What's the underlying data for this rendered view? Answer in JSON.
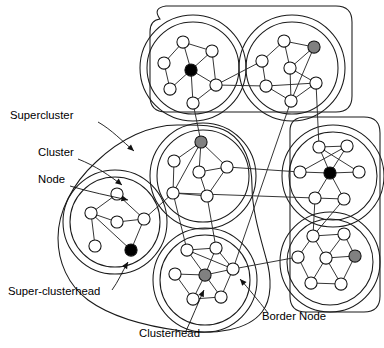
{
  "figure": {
    "node_kinds": {
      "plain": "Node",
      "clusterhead": "Clusterhead",
      "super_clusterhead": "Super-clusterhead",
      "border": "Border Node"
    },
    "colors": {
      "plain_fill": "#ffffff",
      "clusterhead_fill": "#808080",
      "super_clusterhead_fill": "#000000",
      "stroke": "#111111",
      "background": "#ffffff"
    },
    "counts": {
      "superclusters": 3,
      "clusters": 7,
      "clusterheads": 4,
      "super_clusterheads": 3
    }
  },
  "labels": [
    {
      "id": "supercluster",
      "text": "Supercluster",
      "x": 10,
      "y": 119,
      "anchor": "start"
    },
    {
      "id": "cluster",
      "text": "Cluster",
      "x": 38,
      "y": 156,
      "anchor": "start"
    },
    {
      "id": "node",
      "text": "Node",
      "x": 38,
      "y": 183,
      "anchor": "start"
    },
    {
      "id": "super-clusterhead",
      "text": "Super-clusterhead",
      "x": 8,
      "y": 295,
      "anchor": "start"
    },
    {
      "id": "clusterhead",
      "text": "Clusterhead",
      "x": 139,
      "y": 337,
      "anchor": "start"
    },
    {
      "id": "border-node",
      "text": "Border Node",
      "x": 262,
      "y": 320,
      "anchor": "start"
    }
  ],
  "leaders": [
    {
      "id": "leader-supercluster",
      "d": "M 98 122 C 112 130, 122 141, 134 151",
      "arrow": [
        134,
        151,
        0.72
      ]
    },
    {
      "id": "leader-cluster",
      "d": "M 78 159 C 96 166, 110 176, 122 185",
      "arrow": [
        122,
        185,
        0.68
      ]
    },
    {
      "id": "leader-node",
      "d": "M 70 186 C 90 192, 110 196, 128 200",
      "arrow": [
        128,
        200,
        0.25
      ]
    },
    {
      "id": "leader-super-clusterhead",
      "d": "M 112 290 C 118 282, 122 272, 128 262",
      "arrow": [
        128,
        262,
        -1.03
      ]
    },
    {
      "id": "leader-clusterhead",
      "d": "M 186 331 C 192 318, 198 303, 204 290",
      "arrow": [
        204,
        290,
        -1.12
      ]
    },
    {
      "id": "leader-border-node",
      "d": "M 268 313 C 258 300, 248 288, 240 279",
      "arrow": [
        240,
        279,
        -2.3
      ]
    }
  ],
  "superclusters": [
    {
      "id": "supercluster-top",
      "shape": "rounded-rect",
      "d": "M 160 19 Q 152 8 166 6 L 336 6 Q 352 6 352 22 L 352 96 Q 352 112 336 112 L 166 112 Q 150 112 150 96 L 150 32 Q 150 20 160 19 Z",
      "contains": [
        "cluster-top-left",
        "cluster-top-right"
      ]
    },
    {
      "id": "supercluster-right",
      "shape": "rounded-rect-vertical",
      "d": "M 290 131 Q 290 117 306 117 L 364 117 Q 380 117 380 133 L 380 296 Q 380 312 364 312 L 306 312 Q 290 312 290 296 Z",
      "contains": [
        "cluster-right-top",
        "cluster-right-bottom"
      ]
    },
    {
      "id": "supercluster-left",
      "shape": "irregular-blob",
      "d": "M 180 125 C 150 124, 120 139, 96 162 C 72 184, 58 212, 58 238 C 58 262, 68 285, 88 300 C 110 316, 144 326, 182 331 C 216 335, 248 330, 262 312 C 272 299, 272 278, 266 258 C 260 236, 252 210, 252 186 C 252 162, 244 142, 228 132 C 214 124, 196 125, 180 125 Z",
      "contains": [
        "cluster-left",
        "cluster-center",
        "cluster-bottom-center"
      ]
    }
  ],
  "clusters": [
    {
      "id": "cluster-top-left",
      "cx": 193,
      "cy": 68,
      "r": 46,
      "outer_r": 53
    },
    {
      "id": "cluster-top-right",
      "cx": 292,
      "cy": 68,
      "r": 46,
      "outer_r": 53
    },
    {
      "id": "cluster-left",
      "cx": 115,
      "cy": 222,
      "r": 45,
      "outer_r": 52
    },
    {
      "id": "cluster-center",
      "cx": 203,
      "cy": 176,
      "r": 46,
      "outer_r": 53
    },
    {
      "id": "cluster-bottom-center",
      "cx": 205,
      "cy": 280,
      "r": 45,
      "outer_r": 52
    },
    {
      "id": "cluster-right-top",
      "cx": 333,
      "cy": 176,
      "r": 44,
      "outer_r": 51
    },
    {
      "id": "cluster-right-bottom",
      "cx": 330,
      "cy": 262,
      "r": 43,
      "outer_r": 50
    }
  ],
  "nodes": [
    {
      "id": "tl-1",
      "cluster": "cluster-top-left",
      "x": 183,
      "y": 42,
      "kind": "plain"
    },
    {
      "id": "tl-2",
      "cluster": "cluster-top-left",
      "x": 212,
      "y": 51,
      "kind": "plain"
    },
    {
      "id": "tl-3",
      "cluster": "cluster-top-left",
      "x": 164,
      "y": 63,
      "kind": "plain"
    },
    {
      "id": "tl-4",
      "cluster": "cluster-top-left",
      "x": 191,
      "y": 70,
      "kind": "super_clusterhead"
    },
    {
      "id": "tl-5",
      "cluster": "cluster-top-left",
      "x": 170,
      "y": 89,
      "kind": "plain"
    },
    {
      "id": "tl-6",
      "cluster": "cluster-top-left",
      "x": 216,
      "y": 85,
      "kind": "border"
    },
    {
      "id": "tl-7",
      "cluster": "cluster-top-left",
      "x": 193,
      "y": 103,
      "kind": "plain"
    },
    {
      "id": "tr-1",
      "cluster": "cluster-top-right",
      "x": 284,
      "y": 41,
      "kind": "plain"
    },
    {
      "id": "tr-2",
      "cluster": "cluster-top-right",
      "x": 314,
      "y": 47,
      "kind": "clusterhead"
    },
    {
      "id": "tr-3",
      "cluster": "cluster-top-right",
      "x": 262,
      "y": 61,
      "kind": "border"
    },
    {
      "id": "tr-4",
      "cluster": "cluster-top-right",
      "x": 290,
      "y": 68,
      "kind": "plain"
    },
    {
      "id": "tr-5",
      "cluster": "cluster-top-right",
      "x": 266,
      "y": 86,
      "kind": "border"
    },
    {
      "id": "tr-6",
      "cluster": "cluster-top-right",
      "x": 316,
      "y": 83,
      "kind": "plain"
    },
    {
      "id": "tr-7",
      "cluster": "cluster-top-right",
      "x": 291,
      "y": 101,
      "kind": "border"
    },
    {
      "id": "lf-1",
      "cluster": "cluster-left",
      "x": 117,
      "y": 194,
      "kind": "plain"
    },
    {
      "id": "lf-2",
      "cluster": "cluster-left",
      "x": 91,
      "y": 213,
      "kind": "plain"
    },
    {
      "id": "lf-3",
      "cluster": "cluster-left",
      "x": 117,
      "y": 222,
      "kind": "plain"
    },
    {
      "id": "lf-4",
      "cluster": "cluster-left",
      "x": 144,
      "y": 219,
      "kind": "border"
    },
    {
      "id": "lf-5",
      "cluster": "cluster-left",
      "x": 95,
      "y": 246,
      "kind": "plain"
    },
    {
      "id": "lf-6",
      "cluster": "cluster-left",
      "x": 131,
      "y": 250,
      "kind": "super_clusterhead"
    },
    {
      "id": "ct-1",
      "cluster": "cluster-center",
      "x": 201,
      "y": 142,
      "kind": "clusterhead"
    },
    {
      "id": "ct-2",
      "cluster": "cluster-center",
      "x": 174,
      "y": 161,
      "kind": "plain"
    },
    {
      "id": "ct-3",
      "cluster": "cluster-center",
      "x": 199,
      "y": 172,
      "kind": "plain"
    },
    {
      "id": "ct-4",
      "cluster": "cluster-center",
      "x": 227,
      "y": 167,
      "kind": "border"
    },
    {
      "id": "ct-5",
      "cluster": "cluster-center",
      "x": 173,
      "y": 193,
      "kind": "border"
    },
    {
      "id": "ct-6",
      "cluster": "cluster-center",
      "x": 207,
      "y": 196,
      "kind": "plain"
    },
    {
      "id": "bc-1",
      "cluster": "cluster-bottom-center",
      "x": 187,
      "y": 250,
      "kind": "plain"
    },
    {
      "id": "bc-2",
      "cluster": "cluster-bottom-center",
      "x": 216,
      "y": 248,
      "kind": "plain"
    },
    {
      "id": "bc-3",
      "cluster": "cluster-bottom-center",
      "x": 175,
      "y": 274,
      "kind": "plain"
    },
    {
      "id": "bc-4",
      "cluster": "cluster-bottom-center",
      "x": 205,
      "y": 275,
      "kind": "clusterhead"
    },
    {
      "id": "bc-5",
      "cluster": "cluster-bottom-center",
      "x": 233,
      "y": 269,
      "kind": "border"
    },
    {
      "id": "bc-6",
      "cluster": "cluster-bottom-center",
      "x": 193,
      "y": 299,
      "kind": "plain"
    },
    {
      "id": "bc-7",
      "cluster": "cluster-bottom-center",
      "x": 221,
      "y": 297,
      "kind": "plain"
    },
    {
      "id": "rt-1",
      "cluster": "cluster-right-top",
      "x": 319,
      "y": 147,
      "kind": "plain"
    },
    {
      "id": "rt-2",
      "cluster": "cluster-right-top",
      "x": 347,
      "y": 146,
      "kind": "plain"
    },
    {
      "id": "rt-3",
      "cluster": "cluster-right-top",
      "x": 300,
      "y": 172,
      "kind": "border"
    },
    {
      "id": "rt-4",
      "cluster": "cluster-right-top",
      "x": 330,
      "y": 173,
      "kind": "super_clusterhead"
    },
    {
      "id": "rt-5",
      "cluster": "cluster-right-top",
      "x": 359,
      "y": 172,
      "kind": "plain"
    },
    {
      "id": "rt-6",
      "cluster": "cluster-right-top",
      "x": 315,
      "y": 198,
      "kind": "border"
    },
    {
      "id": "rt-7",
      "cluster": "cluster-right-top",
      "x": 344,
      "y": 199,
      "kind": "plain"
    },
    {
      "id": "rb-1",
      "cluster": "cluster-right-bottom",
      "x": 313,
      "y": 236,
      "kind": "plain"
    },
    {
      "id": "rb-2",
      "cluster": "cluster-right-bottom",
      "x": 344,
      "y": 234,
      "kind": "plain"
    },
    {
      "id": "rb-3",
      "cluster": "cluster-right-bottom",
      "x": 298,
      "y": 257,
      "kind": "border"
    },
    {
      "id": "rb-4",
      "cluster": "cluster-right-bottom",
      "x": 326,
      "y": 258,
      "kind": "plain"
    },
    {
      "id": "rb-5",
      "cluster": "cluster-right-bottom",
      "x": 355,
      "y": 256,
      "kind": "clusterhead"
    },
    {
      "id": "rb-6",
      "cluster": "cluster-right-bottom",
      "x": 311,
      "y": 283,
      "kind": "plain"
    },
    {
      "id": "rb-7",
      "cluster": "cluster-right-bottom",
      "x": 341,
      "y": 284,
      "kind": "plain"
    }
  ],
  "intra_edges": [
    [
      "tl-1",
      "tl-2"
    ],
    [
      "tl-1",
      "tl-3"
    ],
    [
      "tl-1",
      "tl-4"
    ],
    [
      "tl-2",
      "tl-4"
    ],
    [
      "tl-2",
      "tl-6"
    ],
    [
      "tl-3",
      "tl-5"
    ],
    [
      "tl-4",
      "tl-5"
    ],
    [
      "tl-4",
      "tl-7"
    ],
    [
      "tl-6",
      "tl-7"
    ],
    [
      "tl-4",
      "tl-6"
    ],
    [
      "tr-1",
      "tr-2"
    ],
    [
      "tr-1",
      "tr-4"
    ],
    [
      "tr-1",
      "tr-3"
    ],
    [
      "tr-2",
      "tr-4"
    ],
    [
      "tr-2",
      "tr-7"
    ],
    [
      "tr-3",
      "tr-5"
    ],
    [
      "tr-4",
      "tr-7"
    ],
    [
      "tr-5",
      "tr-7"
    ],
    [
      "tr-6",
      "tr-7"
    ],
    [
      "tr-4",
      "tr-6"
    ],
    [
      "tr-5",
      "tr-6"
    ],
    [
      "lf-1",
      "lf-2"
    ],
    [
      "lf-1",
      "lf-4"
    ],
    [
      "lf-2",
      "lf-3"
    ],
    [
      "lf-2",
      "lf-5"
    ],
    [
      "lf-3",
      "lf-4"
    ],
    [
      "lf-2",
      "lf-6"
    ],
    [
      "lf-4",
      "lf-6"
    ],
    [
      "ct-1",
      "ct-2"
    ],
    [
      "ct-1",
      "ct-3"
    ],
    [
      "ct-1",
      "ct-4"
    ],
    [
      "ct-1",
      "ct-5"
    ],
    [
      "ct-2",
      "ct-5"
    ],
    [
      "ct-3",
      "ct-4"
    ],
    [
      "ct-3",
      "ct-6"
    ],
    [
      "ct-4",
      "ct-6"
    ],
    [
      "ct-5",
      "ct-6"
    ],
    [
      "bc-1",
      "bc-2"
    ],
    [
      "bc-1",
      "bc-4"
    ],
    [
      "bc-2",
      "bc-4"
    ],
    [
      "bc-3",
      "bc-4"
    ],
    [
      "bc-4",
      "bc-5"
    ],
    [
      "bc-4",
      "bc-6"
    ],
    [
      "bc-4",
      "bc-7"
    ],
    [
      "bc-6",
      "bc-7"
    ],
    [
      "bc-1",
      "bc-5"
    ],
    [
      "bc-5",
      "bc-7"
    ],
    [
      "bc-2",
      "bc-5"
    ],
    [
      "bc-3",
      "bc-6"
    ],
    [
      "rt-1",
      "rt-2"
    ],
    [
      "rt-1",
      "rt-4"
    ],
    [
      "rt-2",
      "rt-4"
    ],
    [
      "rt-1",
      "rt-5"
    ],
    [
      "rt-2",
      "rt-3"
    ],
    [
      "rt-3",
      "rt-4"
    ],
    [
      "rt-4",
      "rt-5"
    ],
    [
      "rt-4",
      "rt-6"
    ],
    [
      "rt-4",
      "rt-7"
    ],
    [
      "rt-6",
      "rt-7"
    ],
    [
      "rb-1",
      "rb-2"
    ],
    [
      "rb-1",
      "rb-3"
    ],
    [
      "rb-1",
      "rb-4"
    ],
    [
      "rb-2",
      "rb-4"
    ],
    [
      "rb-2",
      "rb-5"
    ],
    [
      "rb-3",
      "rb-6"
    ],
    [
      "rb-4",
      "rb-5"
    ],
    [
      "rb-4",
      "rb-6"
    ],
    [
      "rb-4",
      "rb-7"
    ],
    [
      "rb-6",
      "rb-7"
    ],
    [
      "rb-5",
      "rb-7"
    ]
  ],
  "inter_edges": [
    [
      "tl-6",
      "tr-3"
    ],
    [
      "tl-6",
      "tr-5"
    ],
    [
      "tl-7",
      "ct-1"
    ],
    [
      "tr-7",
      "bc-5"
    ],
    [
      "tr-6",
      "rt-1"
    ],
    [
      "ct-4",
      "rt-3"
    ],
    [
      "ct-5",
      "rt-6"
    ],
    [
      "ct-5",
      "bc-1"
    ],
    [
      "ct-6",
      "bc-2"
    ],
    [
      "lf-4",
      "ct-5"
    ],
    [
      "bc-5",
      "rb-3"
    ],
    [
      "rt-6",
      "rb-1"
    ],
    [
      "rt-7",
      "rb-1"
    ]
  ]
}
